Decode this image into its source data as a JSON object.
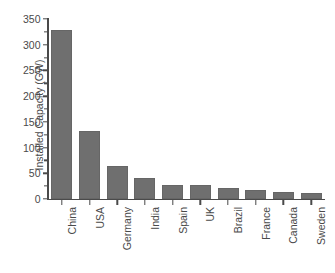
{
  "chart_data": {
    "type": "bar",
    "title": "",
    "xlabel": "",
    "ylabel": "Installed Capacity (GW)",
    "categories": [
      "China",
      "USA",
      "Germany",
      "India",
      "Spain",
      "UK",
      "Brazil",
      "France",
      "Canada",
      "Sweden"
    ],
    "values": [
      328,
      133,
      64,
      40,
      27,
      27,
      21,
      18,
      13,
      12
    ],
    "ylim": [
      0,
      350
    ],
    "yticks": [
      0,
      50,
      100,
      150,
      200,
      250,
      300,
      350
    ],
    "ytick_labels": [
      "0",
      "50",
      "100",
      "150",
      "200",
      "250",
      "300",
      "350"
    ],
    "yminor_interval": 25,
    "grid": false,
    "legend": null,
    "bar_color": "#6f6f6f",
    "axis_color": "#4a4a4a",
    "background": "#ffffff",
    "xlabel_rotation": -90
  }
}
